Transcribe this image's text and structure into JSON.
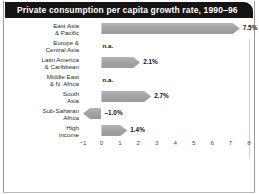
{
  "figure": {
    "title": "Private consumption per capita growth rate, 1990–96"
  },
  "chart_data": {
    "type": "bar",
    "orientation": "horizontal",
    "title": "Private consumption per capita growth rate, 1990–96",
    "xlabel": "",
    "ylabel": "",
    "xlim": [
      -1,
      8
    ],
    "xticks": [
      "−1",
      "0",
      "1",
      "2",
      "3",
      "4",
      "5",
      "6",
      "7",
      "8"
    ],
    "xtick_values": [
      -1,
      0,
      1,
      2,
      3,
      4,
      5,
      6,
      7,
      8
    ],
    "grid": false,
    "legend": "none",
    "bar_color": "#a3a3a3",
    "categories": [
      "East Asia & Pacific",
      "Europe & Central Asia",
      "Latin America & Caribbean",
      "Middle East & N. Africa",
      "South Asia",
      "Sub-Saharan Africa",
      "High income"
    ],
    "values": [
      7.5,
      null,
      2.1,
      null,
      2.7,
      -1.0,
      1.4
    ],
    "rows": [
      {
        "label_lines": [
          "East Asia",
          "& Pacific"
        ],
        "value": 7.5,
        "value_label": "7.5%",
        "available": true
      },
      {
        "label_lines": [
          "Europe &",
          "Central Asia"
        ],
        "value": null,
        "value_label": "n.a.",
        "available": false
      },
      {
        "label_lines": [
          "Latin America",
          "& Caribbean"
        ],
        "value": 2.1,
        "value_label": "2.1%",
        "available": true
      },
      {
        "label_lines": [
          "Middle East",
          "& N. Africa"
        ],
        "value": null,
        "value_label": "n.a.",
        "available": false
      },
      {
        "label_lines": [
          "South",
          "Asia"
        ],
        "value": 2.7,
        "value_label": "2.7%",
        "available": true
      },
      {
        "label_lines": [
          "Sub-Saharan",
          "Africa"
        ],
        "value": -1.0,
        "value_label": "–1.0%",
        "available": true
      },
      {
        "label_lines": [
          "High",
          "income"
        ],
        "value": 1.4,
        "value_label": "1.4%",
        "available": true
      }
    ]
  }
}
